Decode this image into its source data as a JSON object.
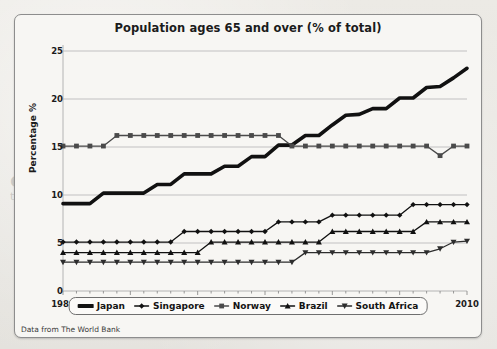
{
  "figure": {
    "title": "Population ages 65 and over (% of total)",
    "source_note": "Data from The World Bank"
  },
  "background_text": {
    "line1": "extending to multiple sons and their",
    "line2": "the home and whose income was the only",
    "line3": "households, a low of less than"
  },
  "axes": {
    "ylabel": "Percentage %",
    "yticks": [
      "0",
      "5",
      "10",
      "15",
      "20",
      "25"
    ],
    "xticks": [
      "1980",
      "1985",
      "1990",
      "1995",
      "2000",
      "2005",
      "2010"
    ]
  },
  "legend": {
    "items": [
      {
        "label": "Japan",
        "marker": "thick-line",
        "color": "#111111"
      },
      {
        "label": "Singapore",
        "marker": "diamond",
        "color": "#111111"
      },
      {
        "label": "Norway",
        "marker": "square",
        "color": "#4a4a4a"
      },
      {
        "label": "Brazil",
        "marker": "triangle-up",
        "color": "#111111"
      },
      {
        "label": "South Africa",
        "marker": "triangle-down",
        "color": "#2d2d2d"
      }
    ]
  },
  "chart_data": {
    "type": "line",
    "title": "Population ages 65 and over (% of total)",
    "xlabel": "",
    "ylabel": "Percentage %",
    "xlim": [
      1980,
      2010
    ],
    "ylim": [
      0,
      25
    ],
    "grid": true,
    "legend_position": "bottom",
    "source": "Data from The World Bank",
    "x": [
      1980,
      1981,
      1982,
      1983,
      1984,
      1985,
      1986,
      1987,
      1988,
      1989,
      1990,
      1991,
      1992,
      1993,
      1994,
      1995,
      1996,
      1997,
      1998,
      1999,
      2000,
      2001,
      2002,
      2003,
      2004,
      2005,
      2006,
      2007,
      2008,
      2009,
      2010
    ],
    "series": [
      {
        "name": "Japan",
        "marker": "thick-line",
        "color": "#111111",
        "values": [
          9.1,
          9.1,
          9.1,
          10.2,
          10.2,
          10.2,
          10.2,
          11.1,
          11.1,
          12.2,
          12.2,
          12.2,
          13.0,
          13.0,
          14.0,
          14.0,
          15.2,
          15.2,
          16.2,
          16.2,
          17.3,
          18.3,
          18.4,
          19.0,
          19.0,
          20.1,
          20.1,
          21.2,
          21.3,
          22.2,
          23.2
        ]
      },
      {
        "name": "Singapore",
        "marker": "diamond",
        "color": "#111111",
        "values": [
          5.1,
          5.1,
          5.1,
          5.1,
          5.1,
          5.1,
          5.1,
          5.1,
          5.1,
          6.2,
          6.2,
          6.2,
          6.2,
          6.2,
          6.2,
          6.2,
          7.2,
          7.2,
          7.2,
          7.2,
          7.9,
          7.9,
          7.9,
          7.9,
          7.9,
          7.9,
          9.0,
          9.0,
          9.0,
          9.0,
          9.0
        ]
      },
      {
        "name": "Norway",
        "marker": "square",
        "color": "#4a4a4a",
        "values": [
          15.1,
          15.1,
          15.1,
          15.1,
          16.2,
          16.2,
          16.2,
          16.2,
          16.2,
          16.2,
          16.2,
          16.2,
          16.2,
          16.2,
          16.2,
          16.2,
          16.2,
          15.1,
          15.1,
          15.1,
          15.1,
          15.1,
          15.1,
          15.1,
          15.1,
          15.1,
          15.1,
          15.1,
          14.1,
          15.1,
          15.1
        ]
      },
      {
        "name": "Brazil",
        "marker": "triangle-up",
        "color": "#111111",
        "values": [
          4.0,
          4.0,
          4.0,
          4.0,
          4.0,
          4.0,
          4.0,
          4.0,
          4.0,
          4.0,
          4.0,
          5.1,
          5.1,
          5.1,
          5.1,
          5.1,
          5.1,
          5.1,
          5.1,
          5.1,
          6.2,
          6.2,
          6.2,
          6.2,
          6.2,
          6.2,
          6.2,
          7.2,
          7.2,
          7.2,
          7.2
        ]
      },
      {
        "name": "South Africa",
        "marker": "triangle-down",
        "color": "#2d2d2d",
        "values": [
          3.0,
          3.0,
          3.0,
          3.0,
          3.0,
          3.0,
          3.0,
          3.0,
          3.0,
          3.0,
          3.0,
          3.0,
          3.0,
          3.0,
          3.0,
          3.0,
          3.0,
          3.0,
          4.0,
          4.0,
          4.0,
          4.0,
          4.0,
          4.0,
          4.0,
          4.0,
          4.0,
          4.0,
          4.4,
          5.1,
          5.2
        ]
      }
    ]
  }
}
